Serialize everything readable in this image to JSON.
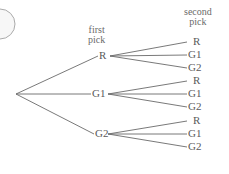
{
  "diagram": {
    "type": "tree",
    "headers": {
      "first": [
        "first",
        "pick"
      ],
      "second": [
        "second",
        "pick"
      ]
    },
    "first_pick": [
      "R",
      "G1",
      "G2"
    ],
    "second_pick": {
      "R": [
        "R",
        "G1",
        "G2"
      ],
      "G1": [
        "R",
        "G1",
        "G2"
      ],
      "G2": [
        "R",
        "G1",
        "G2"
      ]
    },
    "colors": {
      "line": "#6a6a6a",
      "text": "#5a5a5a"
    }
  }
}
